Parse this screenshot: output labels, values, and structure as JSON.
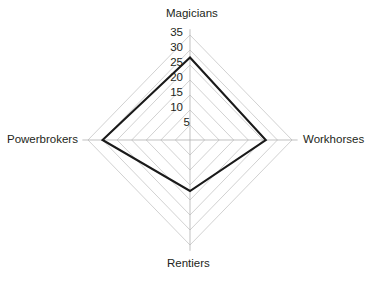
{
  "chart_data": {
    "type": "radar",
    "title": "",
    "subtitle": "",
    "xlabel": "",
    "ylabel": "",
    "categories": [
      "Magicians",
      "Workhorses",
      "Rentiers",
      "Powerbrokers"
    ],
    "values": [
      27.5,
      26,
      17,
      30
    ],
    "series": [
      {
        "name": "",
        "values": [
          27.5,
          26,
          17,
          30
        ]
      }
    ],
    "axis_max": 35,
    "axis_min": 0,
    "rlim": [
      0,
      35
    ],
    "tick_values": [
      35,
      30,
      25,
      20,
      15,
      10,
      5
    ],
    "tick_labels": [
      "35",
      "30",
      "25",
      "20",
      "15",
      "10",
      "5"
    ],
    "grid": true,
    "grid_rings": 7,
    "legend": false,
    "legend_position": "none",
    "shape": "diamond",
    "fill": false,
    "line_color": "#1a1a1a",
    "grid_color": "#c9c9c9",
    "axis_color": "#b5b5b5",
    "text_color": "#231f20",
    "background_color": "#ffffff"
  },
  "axes": {
    "top": "Magicians",
    "right": "Workhorses",
    "bottom": "Rentiers",
    "left": "Powerbrokers"
  },
  "ticks": {
    "t35": "35",
    "t30": "30",
    "t25": "25",
    "t20": "20",
    "t15": "15",
    "t10": "10",
    "t5": "5"
  }
}
